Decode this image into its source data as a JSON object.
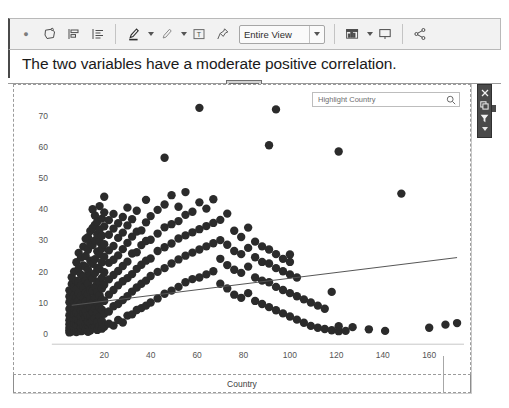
{
  "window": {
    "background": "#ffffff"
  },
  "toolbar": {
    "items": [
      {
        "name": "overflow-dot",
        "label": "·"
      },
      {
        "name": "annotate-shape-icon",
        "label": "Shape"
      },
      {
        "name": "align-left-icon",
        "label": "Align Left"
      },
      {
        "name": "align-text-icon",
        "label": "Align Text"
      },
      {
        "name": "highlighter-icon",
        "label": "Highlighter"
      },
      {
        "name": "pen-icon",
        "label": "Pen"
      },
      {
        "name": "text-box-icon",
        "label": "Text Box"
      },
      {
        "name": "pin-icon",
        "label": "Pin"
      },
      {
        "name": "chart-icon",
        "label": "Chart"
      },
      {
        "name": "present-icon",
        "label": "Present"
      },
      {
        "name": "share-icon",
        "label": "Share"
      }
    ],
    "view_selector": {
      "name": "view-scope-select",
      "value": "Entire View",
      "options": [
        "Entire View"
      ]
    }
  },
  "headline": {
    "text": "The two variables have a moderate positive correlation."
  },
  "search": {
    "placeholder": "Highlight Country",
    "value": "",
    "icon": "search-icon"
  },
  "right_toolbar": {
    "buttons": [
      {
        "name": "close-icon",
        "label": "Close"
      },
      {
        "name": "duplicate-icon",
        "label": "Duplicate"
      },
      {
        "name": "filter-funnel-icon",
        "label": "Filter"
      }
    ],
    "more": {
      "name": "chevron-down-icon",
      "label": "More"
    },
    "background": "#4a4a4a"
  },
  "chart_data": {
    "type": "scatter",
    "title": "The two variables have a moderate positive correlation.",
    "xlabel": "Country",
    "ylabel": "",
    "xlim": [
      0,
      175
    ],
    "ylim": [
      -2,
      76
    ],
    "xticks": [
      20,
      40,
      60,
      80,
      100,
      120,
      140,
      160
    ],
    "yticks": [
      0,
      10,
      20,
      30,
      40,
      50,
      60,
      70
    ],
    "grid": false,
    "legend": null,
    "point_color": "#2b2b2b",
    "point_size": 4.2,
    "trendline": {
      "name": "linear-trend-line",
      "color": "#555555",
      "x": [
        6,
        172
      ],
      "y": [
        9.2,
        24.5
      ]
    },
    "points": [
      [
        5,
        0.5
      ],
      [
        5,
        1.2
      ],
      [
        5,
        2.0
      ],
      [
        5,
        3.1
      ],
      [
        5,
        4.4
      ],
      [
        5,
        6.0
      ],
      [
        5,
        8.0
      ],
      [
        5,
        10.2
      ],
      [
        5,
        12.0
      ],
      [
        5,
        14.0
      ],
      [
        6,
        0.8
      ],
      [
        6,
        2.4
      ],
      [
        6,
        3.8
      ],
      [
        6,
        5.2
      ],
      [
        6,
        7.1
      ],
      [
        6,
        9.0
      ],
      [
        6,
        11.0
      ],
      [
        6,
        13.5
      ],
      [
        6,
        16.0
      ],
      [
        6,
        18.2
      ],
      [
        7,
        1.0
      ],
      [
        7,
        2.2
      ],
      [
        7,
        3.5
      ],
      [
        7,
        5.0
      ],
      [
        7,
        6.4
      ],
      [
        7,
        8.2
      ],
      [
        7,
        10.0
      ],
      [
        7,
        12.5
      ],
      [
        7,
        15.0
      ],
      [
        7,
        20.0
      ],
      [
        8,
        0.6
      ],
      [
        8,
        1.8
      ],
      [
        8,
        3.0
      ],
      [
        8,
        4.8
      ],
      [
        8,
        6.8
      ],
      [
        8,
        9.4
      ],
      [
        8,
        11.8
      ],
      [
        8,
        14.4
      ],
      [
        8,
        17.0
      ],
      [
        8,
        23.0
      ],
      [
        9,
        1.4
      ],
      [
        9,
        2.8
      ],
      [
        9,
        4.2
      ],
      [
        9,
        6.2
      ],
      [
        9,
        8.6
      ],
      [
        9,
        10.8
      ],
      [
        9,
        13.0
      ],
      [
        9,
        16.5
      ],
      [
        9,
        21.0
      ],
      [
        9,
        26.0
      ],
      [
        10,
        0.9
      ],
      [
        10,
        2.0
      ],
      [
        10,
        3.6
      ],
      [
        10,
        5.6
      ],
      [
        10,
        7.6
      ],
      [
        10,
        9.8
      ],
      [
        10,
        12.2
      ],
      [
        10,
        15.5
      ],
      [
        10,
        19.0
      ],
      [
        10,
        24.5
      ],
      [
        11,
        1.2
      ],
      [
        11,
        2.6
      ],
      [
        11,
        4.6
      ],
      [
        11,
        6.6
      ],
      [
        11,
        8.8
      ],
      [
        11,
        11.5
      ],
      [
        11,
        14.8
      ],
      [
        11,
        18.5
      ],
      [
        11,
        22.0
      ],
      [
        11,
        28.0
      ],
      [
        12,
        1.6
      ],
      [
        12,
        3.2
      ],
      [
        12,
        5.4
      ],
      [
        12,
        7.4
      ],
      [
        12,
        10.4
      ],
      [
        12,
        13.2
      ],
      [
        12,
        17.2
      ],
      [
        12,
        21.5
      ],
      [
        12,
        25.0
      ],
      [
        12,
        30.5
      ],
      [
        13,
        0.7
      ],
      [
        13,
        2.9
      ],
      [
        13,
        4.0
      ],
      [
        13,
        6.0
      ],
      [
        13,
        9.2
      ],
      [
        13,
        12.8
      ],
      [
        13,
        16.2
      ],
      [
        13,
        20.5
      ],
      [
        13,
        27.0
      ],
      [
        13,
        31.0
      ],
      [
        14,
        1.1
      ],
      [
        14,
        3.4
      ],
      [
        14,
        5.8
      ],
      [
        14,
        8.4
      ],
      [
        14,
        11.2
      ],
      [
        14,
        14.2
      ],
      [
        14,
        18.8
      ],
      [
        14,
        23.5
      ],
      [
        14,
        29.0
      ],
      [
        14,
        33.0
      ],
      [
        15,
        1.9
      ],
      [
        15,
        4.4
      ],
      [
        15,
        7.0
      ],
      [
        15,
        10.0
      ],
      [
        15,
        13.8
      ],
      [
        15,
        17.8
      ],
      [
        15,
        22.5
      ],
      [
        15,
        28.5
      ],
      [
        15,
        34.0
      ],
      [
        15,
        40.0
      ],
      [
        16,
        2.1
      ],
      [
        16,
        5.1
      ],
      [
        16,
        8.1
      ],
      [
        16,
        11.6
      ],
      [
        16,
        15.2
      ],
      [
        16,
        19.5
      ],
      [
        16,
        24.0
      ],
      [
        16,
        30.0
      ],
      [
        16,
        35.0
      ],
      [
        16,
        38.0
      ],
      [
        17,
        1.3
      ],
      [
        17,
        3.9
      ],
      [
        17,
        6.9
      ],
      [
        17,
        9.9
      ],
      [
        17,
        13.4
      ],
      [
        17,
        16.8
      ],
      [
        17,
        21.2
      ],
      [
        17,
        26.5
      ],
      [
        17,
        32.0
      ],
      [
        17,
        36.0
      ],
      [
        18,
        2.5
      ],
      [
        18,
        5.5
      ],
      [
        18,
        8.5
      ],
      [
        18,
        12.4
      ],
      [
        18,
        16.4
      ],
      [
        18,
        20.8
      ],
      [
        18,
        25.5
      ],
      [
        18,
        29.5
      ],
      [
        18,
        33.5
      ],
      [
        18,
        41.0
      ],
      [
        19,
        1.7
      ],
      [
        19,
        4.1
      ],
      [
        19,
        7.8
      ],
      [
        19,
        11.0
      ],
      [
        19,
        14.6
      ],
      [
        19,
        18.0
      ],
      [
        19,
        23.0
      ],
      [
        19,
        27.5
      ],
      [
        19,
        31.5
      ],
      [
        19,
        37.0
      ],
      [
        20,
        2.3
      ],
      [
        20,
        6.5
      ],
      [
        20,
        10.6
      ],
      [
        20,
        15.8
      ],
      [
        20,
        19.8
      ],
      [
        20,
        24.8
      ],
      [
        20,
        28.8
      ],
      [
        20,
        34.5
      ],
      [
        20,
        39.0
      ],
      [
        20,
        44.0
      ],
      [
        22,
        3.3
      ],
      [
        22,
        7.2
      ],
      [
        22,
        12.6
      ],
      [
        22,
        17.5
      ],
      [
        22,
        22.8
      ],
      [
        22,
        26.8
      ],
      [
        22,
        31.8
      ],
      [
        22,
        36.5
      ],
      [
        24,
        2.7
      ],
      [
        24,
        8.9
      ],
      [
        24,
        14.1
      ],
      [
        24,
        18.9
      ],
      [
        24,
        23.8
      ],
      [
        24,
        28.2
      ],
      [
        24,
        33.8
      ],
      [
        24,
        38.5
      ],
      [
        26,
        4.5
      ],
      [
        26,
        9.6
      ],
      [
        26,
        15.6
      ],
      [
        26,
        20.2
      ],
      [
        26,
        25.2
      ],
      [
        26,
        30.8
      ],
      [
        26,
        35.5
      ],
      [
        28,
        3.7
      ],
      [
        28,
        10.9
      ],
      [
        28,
        16.9
      ],
      [
        28,
        21.8
      ],
      [
        28,
        27.2
      ],
      [
        28,
        32.5
      ],
      [
        28,
        37.5
      ],
      [
        30,
        5.9
      ],
      [
        30,
        12.1
      ],
      [
        30,
        17.9
      ],
      [
        30,
        23.2
      ],
      [
        30,
        29.2
      ],
      [
        30,
        34.8
      ],
      [
        30,
        40.5
      ],
      [
        32,
        6.3
      ],
      [
        32,
        13.6
      ],
      [
        32,
        19.2
      ],
      [
        32,
        25.8
      ],
      [
        32,
        31.2
      ],
      [
        32,
        36.8
      ],
      [
        34,
        7.7
      ],
      [
        34,
        14.9
      ],
      [
        34,
        20.9
      ],
      [
        34,
        26.2
      ],
      [
        34,
        32.8
      ],
      [
        34,
        39.5
      ],
      [
        36,
        8.3
      ],
      [
        36,
        16.1
      ],
      [
        36,
        22.2
      ],
      [
        36,
        28.5
      ],
      [
        36,
        33.2
      ],
      [
        38,
        9.1
      ],
      [
        38,
        17.1
      ],
      [
        38,
        23.5
      ],
      [
        38,
        29.8
      ],
      [
        38,
        35.8
      ],
      [
        38,
        43.0
      ],
      [
        40,
        10.1
      ],
      [
        40,
        18.6
      ],
      [
        40,
        24.2
      ],
      [
        40,
        30.2
      ],
      [
        40,
        37.8
      ],
      [
        43,
        11.4
      ],
      [
        43,
        19.9
      ],
      [
        43,
        26.6
      ],
      [
        43,
        32.2
      ],
      [
        43,
        39.8
      ],
      [
        46,
        12.9
      ],
      [
        46,
        21.1
      ],
      [
        46,
        27.8
      ],
      [
        46,
        34.2
      ],
      [
        46,
        41.5
      ],
      [
        46,
        56.5
      ],
      [
        49,
        13.9
      ],
      [
        49,
        22.6
      ],
      [
        49,
        29.0
      ],
      [
        49,
        35.2
      ],
      [
        49,
        44.5
      ],
      [
        52,
        15.1
      ],
      [
        52,
        23.9
      ],
      [
        52,
        30.6
      ],
      [
        52,
        36.2
      ],
      [
        52,
        40.8
      ],
      [
        55,
        16.6
      ],
      [
        55,
        25.1
      ],
      [
        55,
        31.6
      ],
      [
        55,
        38.2
      ],
      [
        55,
        45.5
      ],
      [
        58,
        17.6
      ],
      [
        58,
        26.1
      ],
      [
        58,
        32.6
      ],
      [
        58,
        39.2
      ],
      [
        61,
        18.1
      ],
      [
        61,
        27.1
      ],
      [
        61,
        33.6
      ],
      [
        61,
        42.2
      ],
      [
        61,
        72.5
      ],
      [
        64,
        19.1
      ],
      [
        64,
        28.1
      ],
      [
        64,
        34.6
      ],
      [
        64,
        40.2
      ],
      [
        67,
        20.1
      ],
      [
        67,
        29.1
      ],
      [
        67,
        35.6
      ],
      [
        67,
        43.2
      ],
      [
        70,
        16.1
      ],
      [
        70,
        24.1
      ],
      [
        70,
        30.1
      ],
      [
        70,
        36.6
      ],
      [
        73,
        14.6
      ],
      [
        73,
        22.1
      ],
      [
        73,
        28.6
      ],
      [
        73,
        38.6
      ],
      [
        76,
        12.6
      ],
      [
        76,
        20.6
      ],
      [
        76,
        26.6
      ],
      [
        76,
        33.1
      ],
      [
        79,
        11.6
      ],
      [
        79,
        19.6
      ],
      [
        79,
        25.6
      ],
      [
        79,
        31.1
      ],
      [
        82,
        13.1
      ],
      [
        82,
        21.6
      ],
      [
        82,
        27.6
      ],
      [
        82,
        34.1
      ],
      [
        85,
        10.6
      ],
      [
        85,
        18.1
      ],
      [
        85,
        24.6
      ],
      [
        85,
        29.6
      ],
      [
        88,
        9.6
      ],
      [
        88,
        17.1
      ],
      [
        88,
        23.1
      ],
      [
        88,
        28.1
      ],
      [
        91,
        8.6
      ],
      [
        91,
        16.6
      ],
      [
        91,
        22.6
      ],
      [
        91,
        27.1
      ],
      [
        91,
        60.5
      ],
      [
        94,
        7.6
      ],
      [
        94,
        15.1
      ],
      [
        94,
        21.1
      ],
      [
        94,
        25.6
      ],
      [
        94,
        72.0
      ],
      [
        97,
        6.6
      ],
      [
        97,
        14.1
      ],
      [
        97,
        20.1
      ],
      [
        97,
        24.1
      ],
      [
        100,
        5.6
      ],
      [
        100,
        13.1
      ],
      [
        100,
        19.1
      ],
      [
        100,
        23.1
      ],
      [
        100,
        25.5
      ],
      [
        103,
        4.6
      ],
      [
        103,
        12.1
      ],
      [
        103,
        18.1
      ],
      [
        106,
        3.6
      ],
      [
        106,
        11.1
      ],
      [
        109,
        2.6
      ],
      [
        109,
        10.1
      ],
      [
        112,
        2.0
      ],
      [
        112,
        9.1
      ],
      [
        115,
        1.6
      ],
      [
        115,
        8.1
      ],
      [
        118,
        1.2
      ],
      [
        118,
        13.5
      ],
      [
        121,
        0.9
      ],
      [
        121,
        2.5
      ],
      [
        121,
        58.5
      ],
      [
        124,
        1.0
      ],
      [
        127,
        2.2
      ],
      [
        134,
        1.5
      ],
      [
        141,
        1.0
      ],
      [
        148,
        45.0
      ],
      [
        160,
        2.0
      ],
      [
        167,
        3.0
      ],
      [
        172,
        3.5
      ]
    ]
  }
}
